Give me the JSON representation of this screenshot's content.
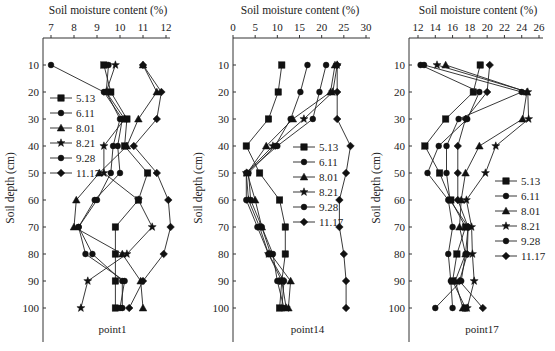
{
  "figure": {
    "x_title": "Soil moisture content (%)",
    "y_title": "Soil depth (cm)"
  },
  "legend": [
    "5.13",
    "6.11",
    "8.01",
    "8.21",
    "9.28",
    "11.17"
  ],
  "markers": [
    "square",
    "circle",
    "triangle",
    "star",
    "circle",
    "diamond"
  ],
  "chart_data": [
    {
      "type": "line",
      "title": "point1",
      "xlabel": "Soil moisture content (%)",
      "ylabel": "Soil depth (cm)",
      "xlim": [
        7,
        12.5
      ],
      "xticks": [
        7,
        8,
        9,
        10,
        11,
        12
      ],
      "ylim": [
        0,
        110
      ],
      "yticks": [
        10,
        20,
        30,
        40,
        50,
        60,
        70,
        80,
        90,
        100
      ],
      "y": [
        10,
        20,
        30,
        40,
        50,
        60,
        70,
        80,
        90,
        100
      ],
      "series": [
        {
          "name": "5.13",
          "values": [
            9.3,
            9.6,
            10.3,
            10.2,
            11.2,
            10.8,
            9.8,
            9.8,
            9.8,
            9.8
          ]
        },
        {
          "name": "6.11",
          "values": [
            7.0,
            9.3,
            10.1,
            9.9,
            10.0,
            8.9,
            8.2,
            8.8,
            10.1,
            10.1
          ]
        },
        {
          "name": "8.01",
          "values": [
            11.0,
            11.6,
            10.8,
            10.3,
            9.1,
            8.1,
            8.0,
            10.1,
            10.9,
            11.0
          ]
        },
        {
          "name": "8.21",
          "values": [
            9.8,
            9.4,
            10.2,
            9.3,
            9.3,
            10.8,
            11.4,
            10.3,
            8.6,
            8.3
          ]
        },
        {
          "name": "9.28",
          "values": [
            9.5,
            9.4,
            10.0,
            9.7,
            9.6,
            9.0,
            8.2,
            8.5,
            10.2,
            10.0
          ]
        },
        {
          "name": "11.17",
          "values": [
            11.0,
            11.8,
            11.6,
            10.6,
            11.6,
            12.1,
            12.2,
            11.9,
            11.0,
            10.4
          ]
        }
      ]
    },
    {
      "type": "line",
      "title": "point14",
      "xlabel": "Soil moisture content (%)",
      "ylabel": "Soil depth (cm)",
      "xlim": [
        0,
        30
      ],
      "xticks": [
        0,
        5,
        10,
        15,
        20,
        25,
        30
      ],
      "ylim": [
        0,
        110
      ],
      "yticks": [
        10,
        20,
        30,
        40,
        50,
        60,
        70,
        80,
        90,
        100
      ],
      "y": [
        10,
        20,
        30,
        40,
        50,
        60,
        70,
        80,
        90,
        100
      ],
      "series": [
        {
          "name": "5.13",
          "values": [
            11.0,
            10.2,
            8.0,
            3.0,
            6.0,
            10.5,
            11.8,
            11.8,
            11.0,
            10.5
          ]
        },
        {
          "name": "6.11",
          "values": [
            16.8,
            15.2,
            13.0,
            9.5,
            3.5,
            4.0,
            6.5,
            9.0,
            10.0,
            11.5
          ]
        },
        {
          "name": "8.01",
          "values": [
            23.0,
            22.0,
            13.5,
            7.5,
            3.2,
            5.0,
            6.5,
            8.5,
            13.0,
            12.5
          ]
        },
        {
          "name": "8.21",
          "values": [
            23.5,
            22.5,
            16.0,
            9.0,
            3.0,
            3.5,
            6.0,
            8.0,
            11.0,
            12.0
          ]
        },
        {
          "name": "9.28",
          "values": [
            21.0,
            19.5,
            18.0,
            10.0,
            3.0,
            3.0,
            5.5,
            8.0,
            11.5,
            11.0
          ]
        },
        {
          "name": "11.17",
          "values": [
            23.5,
            23.5,
            23.5,
            26.5,
            25.5,
            24.0,
            24.0,
            25.0,
            25.5,
            25.5
          ]
        }
      ]
    },
    {
      "type": "line",
      "title": "point17",
      "xlabel": "Soil moisture content (%)",
      "ylabel": "Soil depth (cm)",
      "xlim": [
        12,
        26
      ],
      "xticks": [
        12,
        14,
        16,
        18,
        20,
        22,
        24,
        26
      ],
      "ylim": [
        0,
        110
      ],
      "yticks": [
        10,
        20,
        30,
        40,
        50,
        60,
        70,
        80,
        90,
        100
      ],
      "y": [
        10,
        20,
        30,
        40,
        50,
        60,
        70,
        80,
        90,
        100
      ],
      "series": [
        {
          "name": "5.13",
          "values": [
            19.2,
            18.4,
            15.2,
            12.8,
            14.5,
            15.8,
            17.5,
            16.5,
            16.0,
            17.5
          ]
        },
        {
          "name": "6.11",
          "values": [
            12.3,
            19.1,
            17.7,
            14.4,
            13.1,
            15.5,
            16.0,
            15.5,
            15.8,
            16.0
          ]
        },
        {
          "name": "8.01",
          "values": [
            15.2,
            24.6,
            24.1,
            19.1,
            17.5,
            17.0,
            16.8,
            17.5,
            16.3,
            17.2
          ]
        },
        {
          "name": "8.21",
          "values": [
            14.2,
            24.7,
            24.8,
            21.0,
            19.8,
            17.6,
            18.2,
            18.3,
            18.5,
            17.7
          ]
        },
        {
          "name": "9.28",
          "values": [
            12.7,
            24.0,
            16.7,
            15.3,
            15.3,
            15.7,
            17.8,
            17.5,
            17.0,
            14.0
          ]
        },
        {
          "name": "11.17",
          "values": [
            20.3,
            20.0,
            17.5,
            16.6,
            16.6,
            16.6,
            17.8,
            17.7,
            16.8,
            19.5
          ]
        }
      ]
    }
  ]
}
